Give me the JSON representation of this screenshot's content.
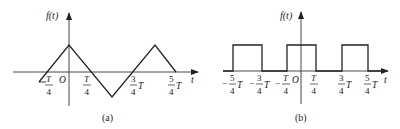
{
  "panels": [
    {
      "id": "a",
      "caption": "(a)",
      "y_axis_label": "f(t)",
      "x_axis_label": "t",
      "origin_label": "O",
      "waveform": "triangle",
      "tick_labels": {
        "neg_quarter": {
          "sign": "−",
          "num": "T",
          "den": "4"
        },
        "quarter": {
          "num": "T",
          "den": "4"
        },
        "three_quarter": {
          "num": "3",
          "den": "4",
          "suffix": "T"
        },
        "five_quarter": {
          "num": "5",
          "den": "4",
          "suffix": "T"
        }
      }
    },
    {
      "id": "b",
      "caption": "(b)",
      "y_axis_label": "f(t)",
      "x_axis_label": "t",
      "origin_label": "O",
      "waveform": "rectangular pulse train",
      "tick_labels": {
        "neg_five_quarter": {
          "sign": "−",
          "num": "5",
          "den": "4",
          "suffix": "T"
        },
        "neg_three_quarter": {
          "sign": "−",
          "num": "3",
          "den": "4",
          "suffix": "T"
        },
        "neg_quarter": {
          "sign": "−",
          "num": "T",
          "den": "4"
        },
        "quarter": {
          "num": "T",
          "den": "4"
        },
        "three_quarter": {
          "num": "3",
          "den": "4",
          "suffix": "T"
        },
        "five_quarter": {
          "num": "5",
          "den": "4",
          "suffix": "T"
        }
      }
    }
  ],
  "colors": {
    "line": "#222222",
    "background": "#ffffff"
  }
}
